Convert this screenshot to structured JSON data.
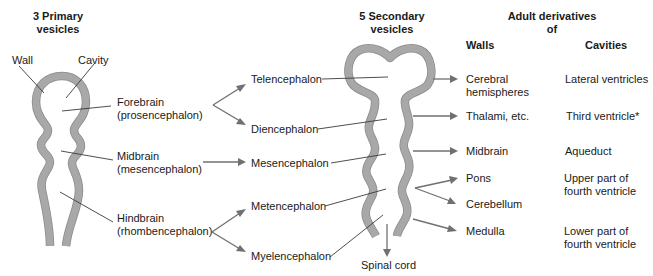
{
  "headers": {
    "primary": [
      "3 Primary",
      "vesicles"
    ],
    "secondary": [
      "5 Secondary",
      "vesicles"
    ],
    "adult": [
      "Adult derivatives",
      "of"
    ],
    "walls": "Walls",
    "cavities": "Cavities"
  },
  "primary_labels": {
    "wall": "Wall",
    "cavity": "Cavity",
    "forebrain": [
      "Forebrain",
      "(prosencephalon)"
    ],
    "midbrain": [
      "Midbrain",
      "(mesencephalon)"
    ],
    "hindbrain": [
      "Hindbrain",
      "(rhombencephalon)"
    ]
  },
  "secondary_labels": {
    "telencephalon": "Telencephalon",
    "diencephalon": "Diencephalon",
    "mesencephalon": "Mesencephalon",
    "metencephalon": "Metencephalon",
    "myelencephalon": "Myelencephalon",
    "spinal_cord": "Spinal cord"
  },
  "walls": {
    "cerebral": [
      "Cerebral",
      "hemispheres"
    ],
    "thalami": "Thalami, etc.",
    "midbrain": "Midbrain",
    "pons": "Pons",
    "cerebellum": "Cerebellum",
    "medulla": "Medulla"
  },
  "cavities": {
    "lateral": "Lateral ventricles",
    "third": "Third ventricle*",
    "aqueduct": "Aqueduct",
    "upper_fourth": [
      "Upper part of",
      "fourth ventricle"
    ],
    "lower_fourth": [
      "Lower part of",
      "fourth ventricle"
    ]
  },
  "colors": {
    "wall_fill": "#a8a8a8",
    "arrow": "#707070",
    "text": "#1a1a1a"
  }
}
